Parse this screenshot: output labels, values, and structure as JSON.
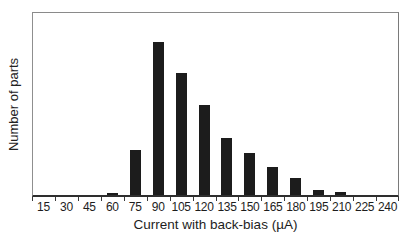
{
  "chart_data": {
    "type": "bar",
    "title": "",
    "xlabel": "Current with back-bias (µA)",
    "ylabel": "Number of parts",
    "categories": [
      "15",
      "30",
      "45",
      "60",
      "75",
      "90",
      "105",
      "120",
      "135",
      "150",
      "165",
      "180",
      "195",
      "210",
      "225",
      "240"
    ],
    "values": [
      0,
      0,
      0,
      0.011,
      0.245,
      0.84,
      0.67,
      0.495,
      0.315,
      0.23,
      0.152,
      0.092,
      0.027,
      0.015,
      0,
      0
    ],
    "ylim": [
      0,
      1
    ],
    "y_tick_labels": [],
    "grid": false,
    "legend": "none",
    "bar_color": "#1c1c1c",
    "axis_color": "#3a3a3a",
    "background_color": "#ffffff"
  }
}
